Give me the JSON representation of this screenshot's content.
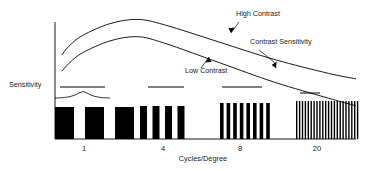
{
  "chart_data": {
    "type": "bar",
    "title": "",
    "xlabel": "Cycles/Degree",
    "ylabel": "Sensitivity",
    "grid": false,
    "legend": "none",
    "x_tick_labels": [
      "1",
      "4",
      "8",
      "20"
    ],
    "x_tick_positions": [
      84,
      163,
      240,
      317
    ],
    "xlim": [
      0,
      22
    ],
    "ylim": [
      0,
      1
    ],
    "annotations": [
      {
        "text": "High Contrast",
        "x": 236,
        "y": 16
      },
      {
        "text": "Contrast Sensitivity",
        "x": 250,
        "y": 44
      },
      {
        "text": "Low Contrast",
        "x": 185,
        "y": 73
      },
      {
        "text": "Sensitivity",
        "x": 9,
        "y": 87
      }
    ],
    "series": [
      {
        "name": "High Contrast",
        "type": "line",
        "points": [
          [
            0.5,
            0.62
          ],
          [
            1,
            0.7
          ],
          [
            2,
            0.8
          ],
          [
            4,
            0.91
          ],
          [
            6,
            0.95
          ],
          [
            8,
            0.9
          ],
          [
            12,
            0.74
          ],
          [
            16,
            0.58
          ],
          [
            20,
            0.45
          ],
          [
            22,
            0.4
          ]
        ]
      },
      {
        "name": "Low Contrast",
        "type": "line",
        "points": [
          [
            0.5,
            0.47
          ],
          [
            1,
            0.54
          ],
          [
            2,
            0.64
          ],
          [
            4,
            0.75
          ],
          [
            6,
            0.79
          ],
          [
            8,
            0.73
          ],
          [
            12,
            0.55
          ],
          [
            16,
            0.37
          ],
          [
            20,
            0.22
          ],
          [
            22,
            0.15
          ]
        ]
      }
    ],
    "grating_groups": [
      {
        "label": "1",
        "bar_count": 3,
        "bar_width": 19.0,
        "gap": 11.0,
        "x_start": 55,
        "top": 107,
        "bottom": 139,
        "marker_line": {
          "x1": 60,
          "x2": 105,
          "y": 87
        }
      },
      {
        "label": "4",
        "bar_count": 4,
        "bar_width": 7.0,
        "gap": 5.5,
        "x_start": 140,
        "top": 106,
        "bottom": 139,
        "marker_line": {
          "x1": 148,
          "x2": 184,
          "y": 87
        }
      },
      {
        "label": "8",
        "bar_count": 8,
        "bar_width": 3.6,
        "gap": 3.0,
        "x_start": 220,
        "top": 103,
        "bottom": 139,
        "marker_line": {
          "x1": 222,
          "x2": 262,
          "y": 87
        }
      },
      {
        "label": "20",
        "bar_count": 22,
        "bar_width": 1.4,
        "gap": 1.5,
        "x_start": 296,
        "top": 101,
        "bottom": 139,
        "marker_line": {
          "x1": 300,
          "x2": 320,
          "y": 93
        }
      }
    ],
    "brace": {
      "x1": 55,
      "x2": 110,
      "y": 98,
      "peak_x": 83
    },
    "colors": {
      "ink": "#000000",
      "text": "#1a1a1a",
      "background": "#ffffff"
    }
  },
  "axes": {
    "y_axis": {
      "x": 55,
      "y_top": 22,
      "y_bottom": 139
    },
    "x_axis": {
      "y": 139,
      "x_left": 55,
      "x_right": 356
    }
  }
}
